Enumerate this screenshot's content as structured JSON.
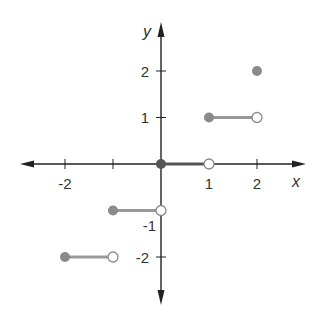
{
  "chart_data": {
    "type": "line",
    "title": "",
    "subtitle": "",
    "xlabel": "x",
    "ylabel": "y",
    "xlim": [
      -2.9,
      3.0
    ],
    "ylim": [
      -3.0,
      3.0
    ],
    "grid": false,
    "legend": null,
    "function": "floor(x)",
    "x_ticks": [
      {
        "value": -2,
        "label": "-2"
      },
      {
        "value": -1,
        "label": ""
      },
      {
        "value": 1,
        "label": "1"
      },
      {
        "value": 2,
        "label": "2"
      }
    ],
    "y_ticks": [
      {
        "value": 2,
        "label": "2"
      },
      {
        "value": 1,
        "label": "1"
      },
      {
        "value": -1,
        "label": "-1"
      },
      {
        "value": -2,
        "label": "-2"
      }
    ],
    "series": [
      {
        "name": "step_-2",
        "x": [
          -2,
          -1
        ],
        "y": [
          -2,
          -2
        ],
        "start": "closed",
        "end": "open"
      },
      {
        "name": "step_-1",
        "x": [
          -1,
          0
        ],
        "y": [
          -1,
          -1
        ],
        "start": "closed",
        "end": "open"
      },
      {
        "name": "step_0",
        "x": [
          0,
          1
        ],
        "y": [
          0,
          0
        ],
        "start": "closed",
        "end": "open"
      },
      {
        "name": "step_1",
        "x": [
          1,
          2
        ],
        "y": [
          1,
          1
        ],
        "start": "closed",
        "end": "open"
      }
    ],
    "points": [
      {
        "x": 2,
        "y": 2,
        "type": "closed"
      }
    ],
    "colors": {
      "axis": "#222222",
      "segment": "#999999",
      "closed_point": "#8a8a8a",
      "open_point_stroke": "#8a8a8a",
      "open_point_fill": "#ffffff"
    }
  }
}
